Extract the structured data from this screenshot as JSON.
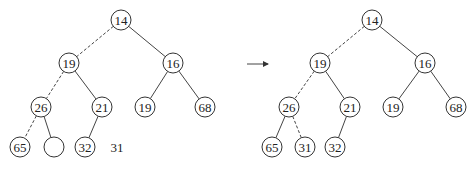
{
  "diagram": {
    "node_radius": 10,
    "arrow": {
      "x1": 247,
      "y1": 64,
      "x2": 268,
      "y2": 64
    },
    "trees": [
      {
        "name": "before",
        "nodes": [
          {
            "id": "a",
            "label": "14",
            "x": 121,
            "y": 20
          },
          {
            "id": "b",
            "label": "19",
            "x": 69,
            "y": 63
          },
          {
            "id": "c",
            "label": "16",
            "x": 173,
            "y": 63
          },
          {
            "id": "d",
            "label": "26",
            "x": 41,
            "y": 107
          },
          {
            "id": "e",
            "label": "21",
            "x": 102,
            "y": 107
          },
          {
            "id": "f",
            "label": "19",
            "x": 145,
            "y": 107
          },
          {
            "id": "g",
            "label": "68",
            "x": 205,
            "y": 107
          },
          {
            "id": "h",
            "label": "65",
            "x": 20,
            "y": 147
          },
          {
            "id": "i",
            "label": "",
            "x": 54,
            "y": 147
          },
          {
            "id": "j",
            "label": "32",
            "x": 85,
            "y": 147
          }
        ],
        "edges": [
          {
            "from": "a",
            "to": "b",
            "dashed": true
          },
          {
            "from": "a",
            "to": "c",
            "dashed": false
          },
          {
            "from": "b",
            "to": "d",
            "dashed": true
          },
          {
            "from": "b",
            "to": "e",
            "dashed": false
          },
          {
            "from": "c",
            "to": "f",
            "dashed": false
          },
          {
            "from": "c",
            "to": "g",
            "dashed": false
          },
          {
            "from": "d",
            "to": "h",
            "dashed": true
          },
          {
            "from": "d",
            "to": "i",
            "dashed": false
          },
          {
            "from": "e",
            "to": "j",
            "dashed": false
          }
        ],
        "free_labels": [
          {
            "label": "31",
            "x": 117,
            "y": 147
          }
        ]
      },
      {
        "name": "after",
        "nodes": [
          {
            "id": "a",
            "label": "14",
            "x": 372,
            "y": 20
          },
          {
            "id": "b",
            "label": "19",
            "x": 320,
            "y": 63
          },
          {
            "id": "c",
            "label": "16",
            "x": 425,
            "y": 63
          },
          {
            "id": "d",
            "label": "26",
            "x": 289,
            "y": 107
          },
          {
            "id": "e",
            "label": "21",
            "x": 350,
            "y": 107
          },
          {
            "id": "f",
            "label": "19",
            "x": 393,
            "y": 107
          },
          {
            "id": "g",
            "label": "68",
            "x": 456,
            "y": 107
          },
          {
            "id": "h",
            "label": "65",
            "x": 272,
            "y": 147
          },
          {
            "id": "i",
            "label": "31",
            "x": 305,
            "y": 147
          },
          {
            "id": "j",
            "label": "32",
            "x": 335,
            "y": 147
          }
        ],
        "edges": [
          {
            "from": "a",
            "to": "b",
            "dashed": true
          },
          {
            "from": "a",
            "to": "c",
            "dashed": false
          },
          {
            "from": "b",
            "to": "d",
            "dashed": true
          },
          {
            "from": "b",
            "to": "e",
            "dashed": false
          },
          {
            "from": "c",
            "to": "f",
            "dashed": false
          },
          {
            "from": "c",
            "to": "g",
            "dashed": false
          },
          {
            "from": "d",
            "to": "h",
            "dashed": false
          },
          {
            "from": "d",
            "to": "i",
            "dashed": true
          },
          {
            "from": "e",
            "to": "j",
            "dashed": false
          }
        ],
        "free_labels": []
      }
    ]
  }
}
